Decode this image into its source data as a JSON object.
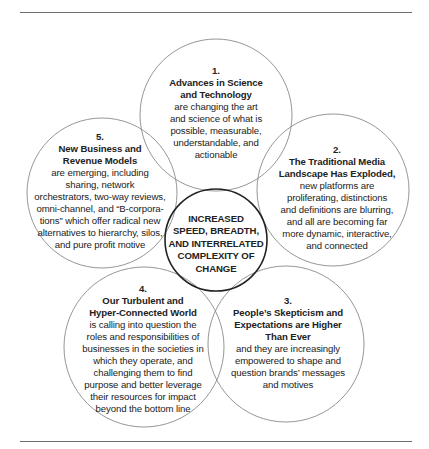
{
  "diagram": {
    "center": {
      "label": "INCREASED\nSPEED, BREADTH,\nAND INTERRELATED\nCOMPLEXITY OF\nCHANGE"
    },
    "items": [
      {
        "number": "1.",
        "title": "Advances in Science\nand Technology",
        "body": "are changing the art\nand science of what is\npossible, measurable,\nunderstandable, and\nactionable"
      },
      {
        "number": "2.",
        "title": "The Traditional Media\nLandscape Has Exploded,",
        "body": "new platforms are\nproliferating, distinctions\nand definitions are blurring,\nand all are becoming far\nmore dynamic, interactive,\nand connected"
      },
      {
        "number": "3.",
        "title": "People’s Skepticism and\nExpectations are Higher\nThan Ever",
        "body": "and they are increasingly\nempowered to shape and\nquestion brands’ messages\nand motives"
      },
      {
        "number": "4.",
        "title": "Our Turbulent and\nHyper-Connected World",
        "body": "is calling into question the\nroles and responsibilities of\nbusinesses in the societies in\nwhich they operate, and\nchallenging them to find\npurpose and better leverage\ntheir resources for impact\nbeyond the bottom line"
      },
      {
        "number": "5.",
        "title": "New Business and\nRevenue Models",
        "body": "are emerging, including\nsharing, network\norchestrators, two-way reviews,\nomni-channel, and “B-corpora-\ntions” which offer radical new\nalternatives to hierarchy, silos,\nand pure profit motive"
      }
    ]
  },
  "colors": {
    "outer_circle_stroke": "#8a8a8a",
    "center_circle_stroke": "#222222",
    "text": "#222222",
    "rule": "#6e6e6e"
  }
}
